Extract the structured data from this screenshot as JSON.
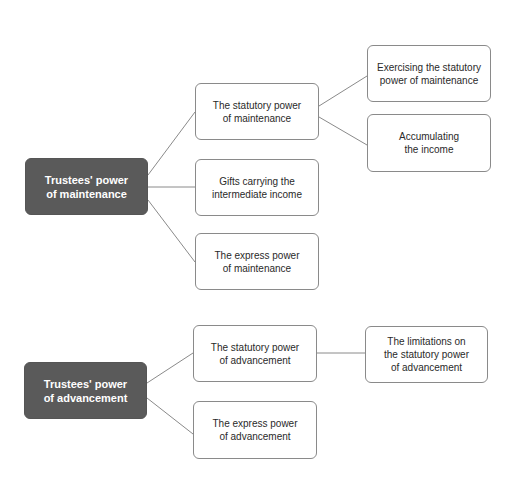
{
  "diagram": {
    "colors": {
      "root_fill": "#5a5a5a",
      "root_text": "#ffffff",
      "border": "#8a8a8a",
      "line": "#8a8a8a"
    },
    "groups": [
      {
        "root": {
          "label": "Trustees' power\nof maintenance"
        },
        "children": [
          {
            "label": "The statutory power\nof maintenance",
            "children": [
              {
                "label": "Exercising the statutory\npower of maintenance"
              },
              {
                "label": "Accumulating\nthe income"
              }
            ]
          },
          {
            "label": "Gifts carrying the\nintermediate income"
          },
          {
            "label": "The express power\nof maintenance"
          }
        ]
      },
      {
        "root": {
          "label": "Trustees' power\nof advancement"
        },
        "children": [
          {
            "label": "The statutory power\nof advancement",
            "children": [
              {
                "label": "The limitations on\nthe statutory power\nof advancement"
              }
            ]
          },
          {
            "label": "The express power\nof advancement"
          }
        ]
      }
    ]
  }
}
